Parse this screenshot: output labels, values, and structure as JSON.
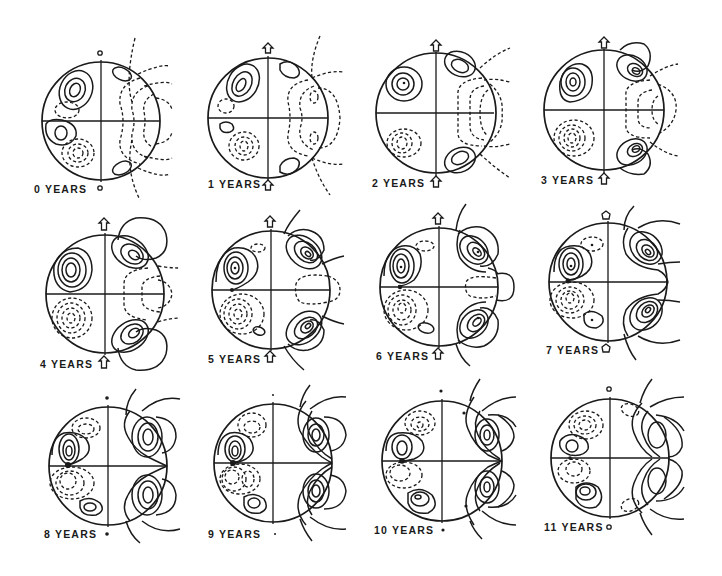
{
  "figure": {
    "stroke_color": "#1a1a1a",
    "background": "#ffffff",
    "panels": [
      {
        "label": "0 YEARS",
        "top_marker": "small-circle",
        "bottom_marker": "small-circle"
      },
      {
        "label": "1 YEARS",
        "top_marker": "arrow-up",
        "bottom_marker": "arrow-up"
      },
      {
        "label": "2 YEARS",
        "top_marker": "arrow-up",
        "bottom_marker": "arrow-up"
      },
      {
        "label": "3 YEARS",
        "top_marker": "arrow-up",
        "bottom_marker": "arrow-up"
      },
      {
        "label": "4 YEARS",
        "top_marker": "arrow-up",
        "bottom_marker": "arrow-up"
      },
      {
        "label": "5 YEARS",
        "top_marker": "arrow-up",
        "bottom_marker": "arrow-up"
      },
      {
        "label": "6 YEARS",
        "top_marker": "arrow-up",
        "bottom_marker": "arrow-up"
      },
      {
        "label": "7 YEARS",
        "top_marker": "small-circle",
        "bottom_marker": "small-circle"
      },
      {
        "label": "8 YEARS",
        "top_marker": "dot",
        "bottom_marker": "dot"
      },
      {
        "label": "9 YEARS",
        "top_marker": "tiny-dot",
        "bottom_marker": "tiny-dot"
      },
      {
        "label": "10 YEARS",
        "top_marker": "dot",
        "bottom_marker": "dot"
      },
      {
        "label": "11 YEARS",
        "top_marker": "small-circle",
        "bottom_marker": "small-circle"
      }
    ]
  }
}
